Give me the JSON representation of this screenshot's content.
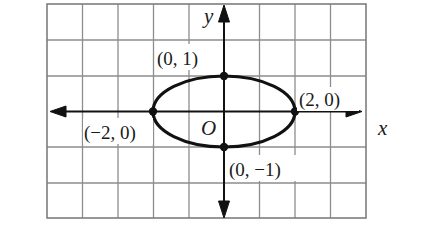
{
  "diagram": {
    "type": "coordinate-plane-ellipse",
    "equation": "x^2/4 + y^2 = 1",
    "grid": {
      "columns": 9,
      "rows": 6,
      "x_range": [
        -5,
        4
      ],
      "y_range": [
        -3,
        3
      ],
      "line_color": "#8a8a8a",
      "border_color": "#7a7a7a"
    },
    "axes": {
      "x_label": "x",
      "y_label": "y",
      "origin_label": "O",
      "color": "#111111"
    },
    "ellipse": {
      "center": [
        0,
        0
      ],
      "semi_major_x": 2,
      "semi_minor_y": 1,
      "stroke": "#111111"
    },
    "points": [
      {
        "id": "top",
        "coords": [
          0,
          1
        ],
        "label": "(0, 1)"
      },
      {
        "id": "right",
        "coords": [
          2,
          0
        ],
        "label": "(2, 0)"
      },
      {
        "id": "left",
        "coords": [
          -2,
          0
        ],
        "label": "(−2, 0)"
      },
      {
        "id": "bottom",
        "coords": [
          0,
          -1
        ],
        "label": "(0, −1)"
      }
    ]
  }
}
